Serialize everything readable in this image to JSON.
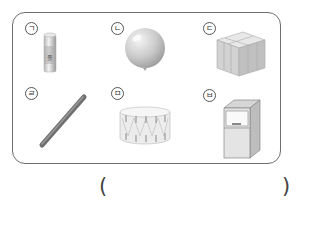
{
  "question": {
    "items": [
      {
        "label": "ㄱ",
        "object": "glue stick",
        "icon": "glue-stick-icon"
      },
      {
        "label": "ㄴ",
        "object": "balloon",
        "icon": "balloon-icon"
      },
      {
        "label": "ㄷ",
        "object": "stacked boxes",
        "icon": "box-stack-icon"
      },
      {
        "label": "ㄹ",
        "object": "rod",
        "icon": "rod-icon"
      },
      {
        "label": "ㅁ",
        "object": "drum",
        "icon": "drum-icon"
      },
      {
        "label": "ㅂ",
        "object": "cabinet",
        "icon": "cabinet-icon"
      }
    ],
    "answer": {
      "open_paren": "(",
      "close_paren": ")",
      "value": ""
    }
  },
  "colors": {
    "frame_border": "#6f6f6f",
    "object_gray": "#c8c8c8",
    "object_dark": "#7a7a7a"
  }
}
